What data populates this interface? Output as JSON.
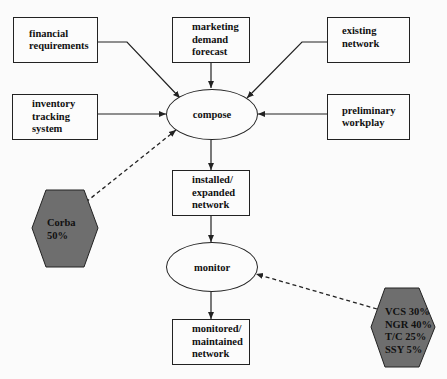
{
  "diagram": {
    "inputs": {
      "financial_requirements": "financial\nrequirements",
      "marketing_demand_forecast": "marketing\ndemand\nforecast",
      "existing_network": "existing\nnetwork",
      "inventory_tracking_system": "inventory\ntracking\nsystem",
      "preliminary_workplay": "preliminary\nworkplay"
    },
    "processes": {
      "compose": "compose",
      "monitor": "monitor"
    },
    "outputs": {
      "installed_expanded_network": "installed/\nexpanded\nnetwork",
      "monitored_maintained_network": "monitored/\nmaintained\nnetwork"
    },
    "tools": {
      "corba": "Corba\n  50%",
      "monitor_tools": "VCS 30%\nNGR 40%\nT/C  25%\nSSY 5%"
    },
    "colors": {
      "hexagon_fill": "#6e6e6e",
      "stroke": "#222222",
      "background": "#fbfbfb"
    }
  }
}
